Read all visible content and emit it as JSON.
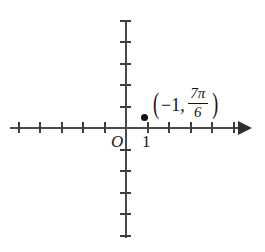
{
  "figure": {
    "type": "polar-point-plot",
    "background_color": "#ffffff",
    "axis_color": "#4a4a4a",
    "point_color": "#111111",
    "text_color": "#141414"
  },
  "axes": {
    "origin_label": "O",
    "x_axis": {
      "has_arrow_positive": true,
      "has_arrow_negative": false,
      "tick_count_negative": 5,
      "tick_count_positive": 5,
      "tick_spacing_px": 21.5,
      "labeled_ticks": [
        {
          "value": "1",
          "x_units": 1
        }
      ]
    },
    "y_axis": {
      "has_arrow_positive": false,
      "has_arrow_negative": false,
      "tick_count_positive": 5,
      "tick_count_negative": 5,
      "tick_spacing_px": 21.5,
      "labeled_ticks": []
    }
  },
  "annotation": {
    "open_paren": "(",
    "radius": "−1,",
    "angle_numerator_number": "7",
    "angle_numerator_symbol": "π",
    "angle_denominator": "6",
    "close_paren": ")",
    "full_text": "(−1, 7π/6)"
  },
  "chart_data": {
    "type": "scatter",
    "title": "",
    "xlabel": "",
    "ylabel": "",
    "xlim": [
      -5.5,
      5.5
    ],
    "ylim": [
      -5,
      5
    ],
    "grid": false,
    "legend": null,
    "xticks": [
      -5,
      -4,
      -3,
      -2,
      -1,
      0,
      1,
      2,
      3,
      4,
      5
    ],
    "xticklabels": [
      "",
      "",
      "",
      "",
      "",
      "O",
      "1",
      "",
      "",
      "",
      ""
    ],
    "yticks": [
      -5,
      -4,
      -3,
      -2,
      -1,
      0,
      1,
      2,
      3,
      4,
      5
    ],
    "yticklabels": [
      "",
      "",
      "",
      "",
      "",
      "",
      "",
      "",
      "",
      "",
      ""
    ],
    "points": [
      {
        "x": 0.88,
        "y": 0.47,
        "label": "(−1, 7π/6)",
        "polar_r": -1,
        "polar_theta": "7π/6",
        "marker": "filled-circle"
      }
    ]
  }
}
